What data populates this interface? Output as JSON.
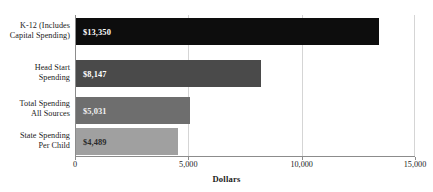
{
  "chart_data": {
    "type": "bar",
    "orientation": "horizontal",
    "title": "",
    "xlabel": "Dollars",
    "ylabel": "",
    "xlim": [
      0,
      15000
    ],
    "xticks": [
      "0",
      "5,000",
      "10,000",
      "15,000"
    ],
    "xtick_values": [
      0,
      5000,
      10000,
      15000
    ],
    "grid": "vertical gridlines at 5,000 and 10,000",
    "legend": "none",
    "categories": [
      "K-12 (Includes Capital Spending)",
      "Head Start Spending",
      "Total Spending All Sources",
      "State Spending Per Child"
    ],
    "category_lines": [
      [
        "K-12 (Includes",
        "Capital Spending)"
      ],
      [
        "Head Start",
        "Spending"
      ],
      [
        "Total Spending",
        "All Sources"
      ],
      [
        "State Spending",
        "Per Child"
      ]
    ],
    "values": [
      13350,
      8147,
      5031,
      4489
    ],
    "value_labels": [
      "$13,350",
      "$8,147",
      "$5,031",
      "$4,489"
    ],
    "bar_colors": [
      "#0d0d0d",
      "#4a4a4a",
      "#6e6e6e",
      "#a0a0a0"
    ],
    "value_label_colors": [
      "#ffffff",
      "#ffffff",
      "#f2f2f2",
      "#2b2b2b"
    ]
  }
}
